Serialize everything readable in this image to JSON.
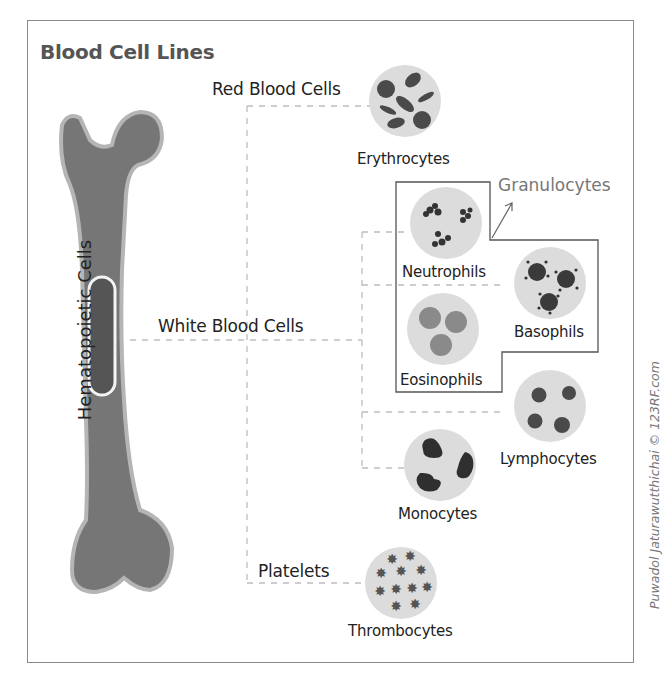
{
  "title": "Blood Cell Lines",
  "bone_label": "Hematopoietic Cells",
  "branches": {
    "red": "Red Blood Cells",
    "white": "White Blood Cells",
    "platelets": "Platelets"
  },
  "group_label": "Granulocytes",
  "cells": {
    "erythrocytes": "Erythrocytes",
    "neutrophils": "Neutrophils",
    "basophils": "Basophils",
    "eosinophils": "Eosinophils",
    "lymphocytes": "Lymphocytes",
    "monocytes": "Monocytes",
    "thrombocytes": "Thrombocytes"
  },
  "credit": "Puwadol Jaturawutthichai © 123RF.com",
  "colors": {
    "bone": "#767676",
    "bone_outline": "#b5b5b5",
    "marrow": "#555555",
    "cell_bg": "#dcdcdc",
    "nucleus": "#4a4a4a",
    "connector": "#bdbdbd",
    "frame": "#8a8a8a"
  }
}
